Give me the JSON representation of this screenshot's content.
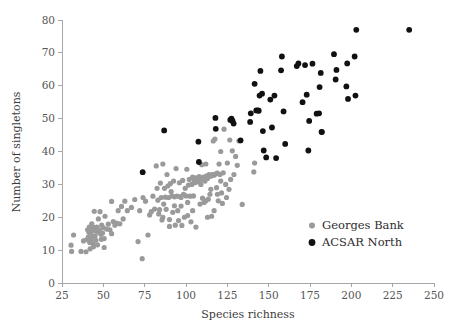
{
  "chart_data": {
    "type": "scatter",
    "title": "",
    "xlabel": "Species richness",
    "ylabel": "Number of singletons",
    "xlim": [
      25,
      250
    ],
    "ylim": [
      0,
      80
    ],
    "xticks": [
      25,
      50,
      75,
      100,
      125,
      150,
      175,
      200,
      225,
      250
    ],
    "yticks": [
      0,
      10,
      20,
      30,
      40,
      50,
      60,
      70,
      80
    ],
    "grid": false,
    "legend_position": "lower-right",
    "series": [
      {
        "name": "Georges Bank",
        "color": "#9a9a9a",
        "marker": "circle",
        "points": [
          [
            30.5,
            11.5
          ],
          [
            30.8,
            9.6
          ],
          [
            32.0,
            14.6
          ],
          [
            36.5,
            9.6
          ],
          [
            38.0,
            12.8
          ],
          [
            39.5,
            9.5
          ],
          [
            40.0,
            13.2
          ],
          [
            40.5,
            16.2
          ],
          [
            41.0,
            14.0
          ],
          [
            41.2,
            15.5
          ],
          [
            41.5,
            17.0
          ],
          [
            41.8,
            12.3
          ],
          [
            42.0,
            10.4
          ],
          [
            42.2,
            16.6
          ],
          [
            42.5,
            14.5
          ],
          [
            42.8,
            13.4
          ],
          [
            43.0,
            18.0
          ],
          [
            43.5,
            15.8
          ],
          [
            43.8,
            12.0
          ],
          [
            44.0,
            16.9
          ],
          [
            44.5,
            21.8
          ],
          [
            45.0,
            14.3
          ],
          [
            45.5,
            13.0
          ],
          [
            46.0,
            17.0
          ],
          [
            46.2,
            15.5
          ],
          [
            46.5,
            16.4
          ],
          [
            47.0,
            19.5
          ],
          [
            47.5,
            16.0
          ],
          [
            48.0,
            21.7
          ],
          [
            48.5,
            14.8
          ],
          [
            48.8,
            13.3
          ],
          [
            49.0,
            17.6
          ],
          [
            49.5,
            15.2
          ],
          [
            50.0,
            16.8
          ],
          [
            50.5,
            13.5
          ],
          [
            51.0,
            20.3
          ],
          [
            52.0,
            16.4
          ],
          [
            53.0,
            17.9
          ],
          [
            54.0,
            16.2
          ],
          [
            55.0,
            24.8
          ],
          [
            56.0,
            18.7
          ],
          [
            57.0,
            17.6
          ],
          [
            58.0,
            18.2
          ],
          [
            59.0,
            22.0
          ],
          [
            60.0,
            18.0
          ],
          [
            61.0,
            23.3
          ],
          [
            63.0,
            24.9
          ],
          [
            64.5,
            22.0
          ],
          [
            67.0,
            23.0
          ],
          [
            69.0,
            25.4
          ],
          [
            71.0,
            12.6
          ],
          [
            72.0,
            22.0
          ],
          [
            73.5,
            7.4
          ],
          [
            74.0,
            26.0
          ],
          [
            75.5,
            24.9
          ],
          [
            77.0,
            14.6
          ],
          [
            78.0,
            20.7
          ],
          [
            79.0,
            21.7
          ],
          [
            80.0,
            26.4
          ],
          [
            81.0,
            22.5
          ],
          [
            82.0,
            35.6
          ],
          [
            82.5,
            28.8
          ],
          [
            83.0,
            25.2
          ],
          [
            83.5,
            21.0
          ],
          [
            84.0,
            22.3
          ],
          [
            84.5,
            30.4
          ],
          [
            85.0,
            26.0
          ],
          [
            85.5,
            19.2
          ],
          [
            86.0,
            36.2
          ],
          [
            86.5,
            24.0
          ],
          [
            87.0,
            28.8
          ],
          [
            87.5,
            26.1
          ],
          [
            88.0,
            22.4
          ],
          [
            88.5,
            33.0
          ],
          [
            89.0,
            29.5
          ],
          [
            89.5,
            26.0
          ],
          [
            90.0,
            19.3
          ],
          [
            90.5,
            30.2
          ],
          [
            91.0,
            27.8
          ],
          [
            91.5,
            26.5
          ],
          [
            92.0,
            21.5
          ],
          [
            92.5,
            31.0
          ],
          [
            93.0,
            26.2
          ],
          [
            93.5,
            17.6
          ],
          [
            94.0,
            34.8
          ],
          [
            94.5,
            26.4
          ],
          [
            95.0,
            22.0
          ],
          [
            95.5,
            19.0
          ],
          [
            96.0,
            30.5
          ],
          [
            96.5,
            26.3
          ],
          [
            97.0,
            26.0
          ],
          [
            97.5,
            17.5
          ],
          [
            98.0,
            31.2
          ],
          [
            98.5,
            27.0
          ],
          [
            99.0,
            20.0
          ],
          [
            99.5,
            28.8
          ],
          [
            100.0,
            26.5
          ],
          [
            100.5,
            34.6
          ],
          [
            101.0,
            24.5
          ],
          [
            101.5,
            29.8
          ],
          [
            102.0,
            31.5
          ],
          [
            102.5,
            26.4
          ],
          [
            103.0,
            18.6
          ],
          [
            103.5,
            30.0
          ],
          [
            104.0,
            32.2
          ],
          [
            104.5,
            26.5
          ],
          [
            105.0,
            31.0
          ],
          [
            105.5,
            30.5
          ],
          [
            106.0,
            32.0
          ],
          [
            106.5,
            31.4
          ],
          [
            107.0,
            31.8
          ],
          [
            107.5,
            30.8
          ],
          [
            108.0,
            32.4
          ],
          [
            108.5,
            31.2
          ],
          [
            109.0,
            30.0
          ],
          [
            109.5,
            36.0
          ],
          [
            110.0,
            31.6
          ],
          [
            110.5,
            32.2
          ],
          [
            111.0,
            24.5
          ],
          [
            111.5,
            31.0
          ],
          [
            112.0,
            36.2
          ],
          [
            112.5,
            32.6
          ],
          [
            113.0,
            31.8
          ],
          [
            113.5,
            25.5
          ],
          [
            114.0,
            33.0
          ],
          [
            114.5,
            27.0
          ],
          [
            115.0,
            32.5
          ],
          [
            115.5,
            20.3
          ],
          [
            116.0,
            33.0
          ],
          [
            116.5,
            43.2
          ],
          [
            117.0,
            32.8
          ],
          [
            117.5,
            43.8
          ],
          [
            118.0,
            33.2
          ],
          [
            118.5,
            29.0
          ],
          [
            119.0,
            33.4
          ],
          [
            119.5,
            25.0
          ],
          [
            120.0,
            36.2
          ],
          [
            120.5,
            33.0
          ],
          [
            121.0,
            40.0
          ],
          [
            121.5,
            27.4
          ],
          [
            122.0,
            24.2
          ],
          [
            122.5,
            33.5
          ],
          [
            123.0,
            46.8
          ],
          [
            124.0,
            30.0
          ],
          [
            124.5,
            26.0
          ],
          [
            125.0,
            36.5
          ],
          [
            126.0,
            28.5
          ],
          [
            126.5,
            43.5
          ],
          [
            127.0,
            31.5
          ],
          [
            128.0,
            40.2
          ],
          [
            129.0,
            33.0
          ],
          [
            130.0,
            38.5
          ],
          [
            131.0,
            35.8
          ],
          [
            132.0,
            43.2
          ],
          [
            133.0,
            43.3
          ],
          [
            134.0,
            23.9
          ],
          [
            141.0,
            33.8
          ],
          [
            141.5,
            36.5
          ],
          [
            86.0,
            20.0
          ],
          [
            90.0,
            17.2
          ],
          [
            93.0,
            23.5
          ],
          [
            97.0,
            23.4
          ],
          [
            101.0,
            20.5
          ],
          [
            104.0,
            22.0
          ],
          [
            106.0,
            17.0
          ],
          [
            108.5,
            24.0
          ],
          [
            110.0,
            25.8
          ],
          [
            112.0,
            25.0
          ],
          [
            113.0,
            20.0
          ],
          [
            115.0,
            28.5
          ],
          [
            117.0,
            22.0
          ],
          [
            119.0,
            27.0
          ],
          [
            121.0,
            31.0
          ],
          [
            44.0,
            11.0
          ],
          [
            46.5,
            11.6
          ],
          [
            50.5,
            10.8
          ],
          [
            55.0,
            15.0
          ],
          [
            62.0,
            19.5
          ]
        ]
      },
      {
        "name": "ACSAR North",
        "color": "#111111",
        "marker": "circle",
        "points": [
          [
            73.8,
            33.7
          ],
          [
            86.8,
            46.4
          ],
          [
            107.5,
            43.0
          ],
          [
            107.8,
            36.8
          ],
          [
            117.8,
            50.2
          ],
          [
            118.0,
            46.9
          ],
          [
            126.8,
            49.6
          ],
          [
            127.5,
            50.0
          ],
          [
            128.2,
            49.3
          ],
          [
            128.8,
            48.5
          ],
          [
            133.0,
            43.4
          ],
          [
            138.8,
            49.0
          ],
          [
            139.2,
            51.6
          ],
          [
            141.5,
            60.6
          ],
          [
            142.5,
            52.5
          ],
          [
            143.5,
            52.5
          ],
          [
            144.0,
            52.4
          ],
          [
            144.5,
            57.0
          ],
          [
            145.0,
            64.5
          ],
          [
            146.0,
            57.6
          ],
          [
            146.5,
            46.2
          ],
          [
            147.0,
            40.3
          ],
          [
            148.5,
            38.2
          ],
          [
            151.0,
            55.8
          ],
          [
            152.0,
            47.3
          ],
          [
            153.5,
            57.0
          ],
          [
            154.5,
            38.0
          ],
          [
            157.5,
            64.7
          ],
          [
            158.0,
            68.9
          ],
          [
            159.0,
            52.2
          ],
          [
            160.0,
            42.3
          ],
          [
            167.0,
            66.0
          ],
          [
            168.0,
            66.8
          ],
          [
            170.5,
            55.0
          ],
          [
            172.0,
            66.3
          ],
          [
            173.0,
            57.3
          ],
          [
            174.0,
            40.3
          ],
          [
            174.5,
            49.3
          ],
          [
            176.5,
            66.7
          ],
          [
            179.0,
            51.5
          ],
          [
            180.5,
            51.6
          ],
          [
            180.8,
            59.6
          ],
          [
            181.5,
            63.9
          ],
          [
            182.0,
            46.0
          ],
          [
            182.2,
            45.9
          ],
          [
            189.5,
            69.6
          ],
          [
            190.5,
            61.9
          ],
          [
            191.0,
            64.8
          ],
          [
            197.0,
            59.8
          ],
          [
            197.5,
            66.8
          ],
          [
            198.0,
            56.0
          ],
          [
            202.0,
            68.9
          ],
          [
            202.5,
            57.0
          ],
          [
            203.0,
            77.0
          ],
          [
            235.0,
            77.0
          ]
        ]
      }
    ]
  },
  "axes": {
    "x_title": "Species richness",
    "y_title": "Number of singletons",
    "x_tick_labels": [
      "25",
      "50",
      "75",
      "100",
      "125",
      "150",
      "175",
      "200",
      "225",
      "250"
    ],
    "y_tick_labels": [
      "0",
      "10",
      "20",
      "30",
      "40",
      "50",
      "60",
      "70",
      "80"
    ]
  },
  "legend": {
    "items": [
      {
        "label": "Georges Bank",
        "color": "#9a9a9a",
        "size": 3.0
      },
      {
        "label": "ACSAR North",
        "color": "#111111",
        "size": 3.4
      }
    ]
  }
}
